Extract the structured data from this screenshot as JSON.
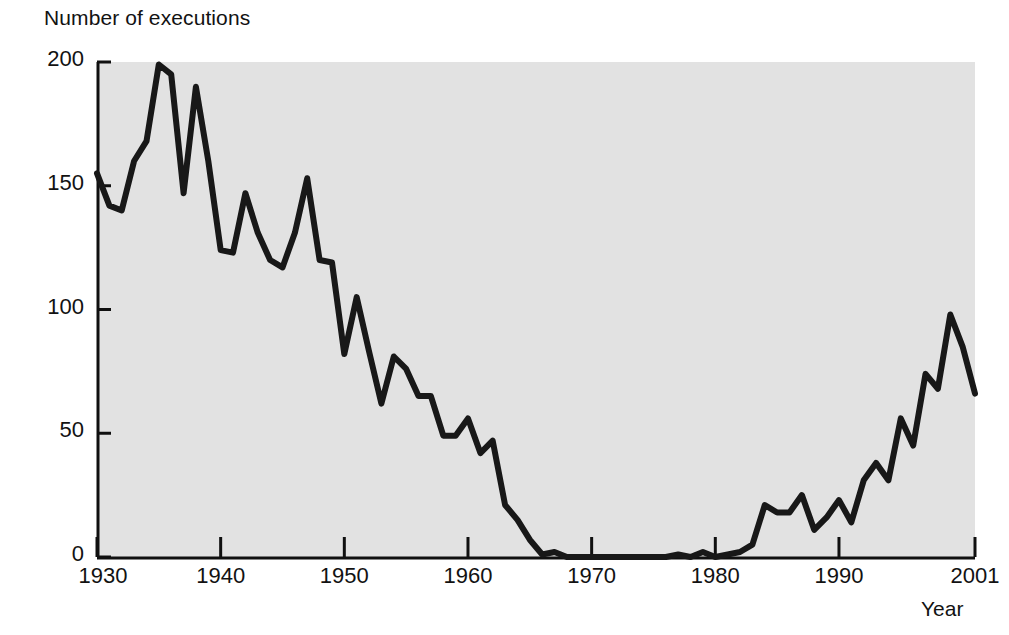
{
  "chart_data": {
    "type": "line",
    "title": "",
    "ylabel": "Number of executions",
    "xlabel": "Year",
    "xlim": [
      1930,
      2001
    ],
    "ylim": [
      0,
      200
    ],
    "yticks": [
      0,
      50,
      100,
      150,
      200
    ],
    "xticks": [
      1930,
      1940,
      1950,
      1960,
      1970,
      1980,
      1990,
      2001
    ],
    "grid": false,
    "legend": null,
    "series": [
      {
        "name": "Executions",
        "x": [
          1930,
          1931,
          1932,
          1933,
          1934,
          1935,
          1936,
          1937,
          1938,
          1939,
          1940,
          1941,
          1942,
          1943,
          1944,
          1945,
          1946,
          1947,
          1948,
          1949,
          1950,
          1951,
          1952,
          1953,
          1954,
          1955,
          1956,
          1957,
          1958,
          1959,
          1960,
          1961,
          1962,
          1963,
          1964,
          1965,
          1966,
          1967,
          1968,
          1969,
          1970,
          1971,
          1972,
          1973,
          1974,
          1975,
          1976,
          1977,
          1978,
          1979,
          1980,
          1981,
          1982,
          1983,
          1984,
          1985,
          1986,
          1987,
          1988,
          1989,
          1990,
          1991,
          1992,
          1993,
          1994,
          1995,
          1996,
          1997,
          1998,
          1999,
          2000,
          2001
        ],
        "values": [
          155,
          142,
          140,
          160,
          168,
          199,
          195,
          147,
          190,
          160,
          124,
          123,
          147,
          131,
          120,
          117,
          131,
          153,
          120,
          119,
          82,
          105,
          83,
          62,
          81,
          76,
          65,
          65,
          49,
          49,
          56,
          42,
          47,
          21,
          15,
          7,
          1,
          2,
          0,
          0,
          0,
          0,
          0,
          0,
          0,
          0,
          0,
          1,
          0,
          2,
          0,
          1,
          2,
          5,
          21,
          18,
          18,
          25,
          11,
          16,
          23,
          14,
          31,
          38,
          31,
          56,
          45,
          74,
          68,
          98,
          85,
          66
        ]
      }
    ]
  },
  "axes": {
    "y_label_text": "Number of executions",
    "x_label_text": "Year",
    "y_tick_labels": [
      "200",
      "150",
      "100",
      "50",
      "0"
    ],
    "x_tick_labels": [
      "1930",
      "1940",
      "1950",
      "1960",
      "1970",
      "1980",
      "1990",
      "2001"
    ]
  },
  "style": {
    "plot_background": "#e2e2e2",
    "line_color": "#181818",
    "axis_color": "#101010",
    "page_background": "#ffffff"
  }
}
